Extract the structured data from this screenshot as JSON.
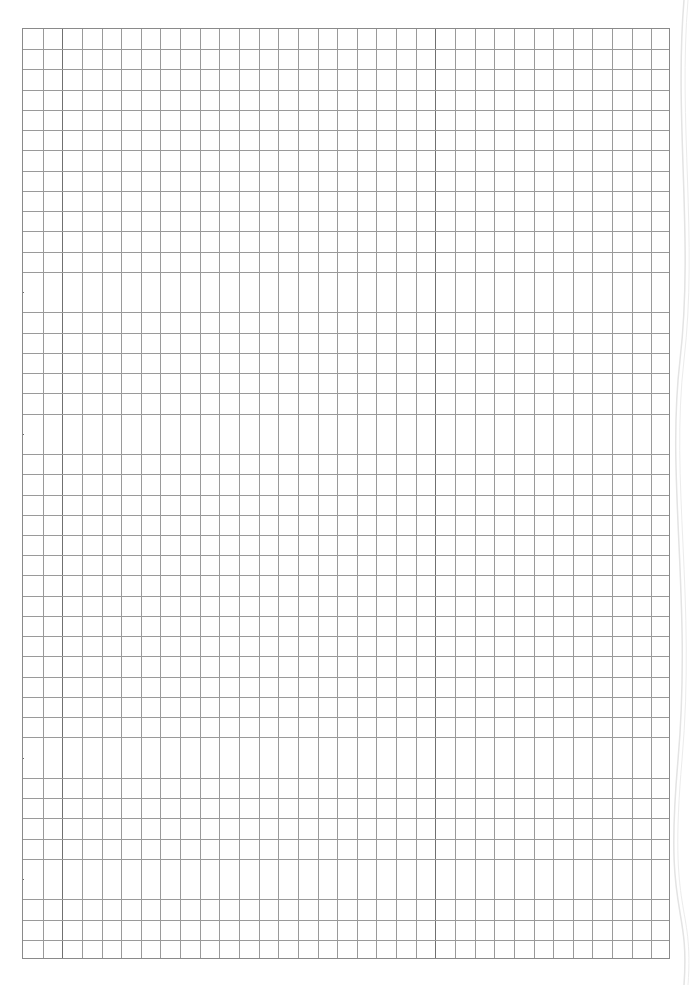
{
  "page": {
    "type": "graph-paper",
    "background": "#ffffff",
    "line_color": "#9a9a9a",
    "major_line_color": "#6e6e6e"
  },
  "grid": {
    "left": 22,
    "top": 28,
    "width": 648,
    "height": 931,
    "columns": 33,
    "rows": 46,
    "major_vertical_x": [
      61,
      437
    ],
    "major_horizontal_y": [
      285,
      433,
      754,
      878
    ]
  }
}
